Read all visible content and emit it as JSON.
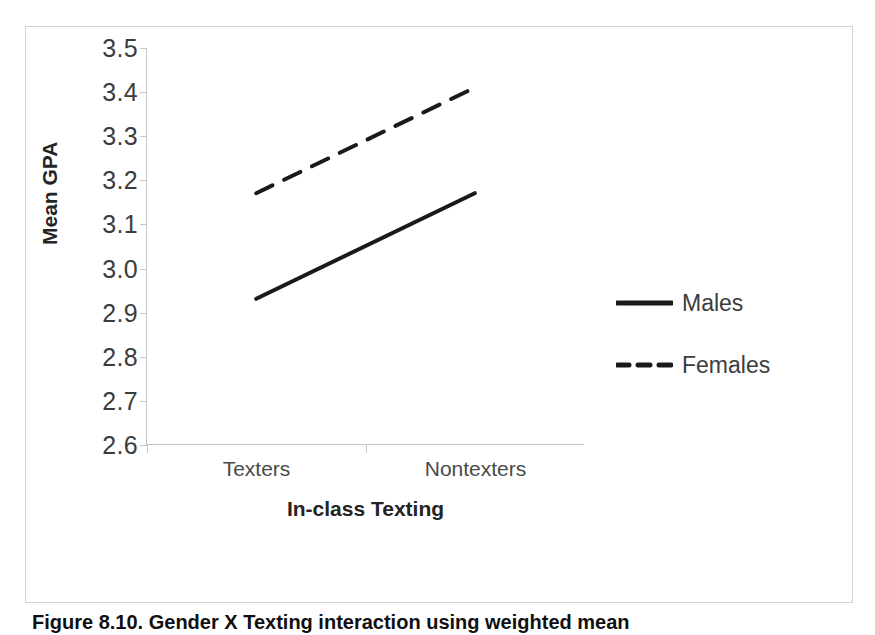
{
  "figure": {
    "caption": "Figure 8.10. Gender X Texting interaction using weighted mean"
  },
  "chart_data": {
    "type": "line",
    "title": "",
    "xlabel": "In-class Texting",
    "ylabel": "Mean GPA",
    "categories": [
      "Texters",
      "Nontexters"
    ],
    "ylim": [
      2.6,
      3.5
    ],
    "yticks": [
      "2.6",
      "2.7",
      "2.8",
      "2.9",
      "3.0",
      "3.1",
      "3.2",
      "3.3",
      "3.4",
      "3.5"
    ],
    "ytick_values": [
      2.6,
      2.7,
      2.8,
      2.9,
      3.0,
      3.1,
      3.2,
      3.3,
      3.4,
      3.5
    ],
    "grid": false,
    "legend_position": "right",
    "series": [
      {
        "name": "Males",
        "values": [
          2.93,
          3.17
        ],
        "style": "solid",
        "color": "#1a1a1a"
      },
      {
        "name": "Females",
        "values": [
          3.17,
          3.41
        ],
        "style": "dashed",
        "color": "#1a1a1a"
      }
    ]
  },
  "legend": {
    "entries": [
      {
        "label": "Males",
        "style": "solid"
      },
      {
        "label": "Females",
        "style": "dashed"
      }
    ]
  }
}
